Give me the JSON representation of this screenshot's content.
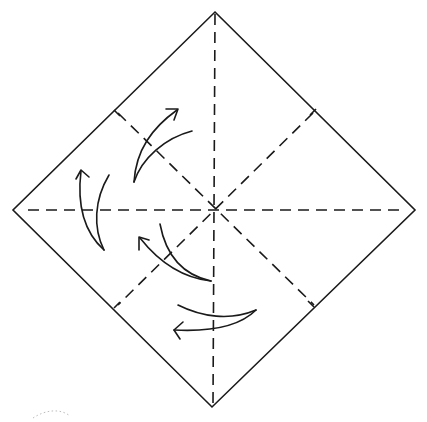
{
  "diagram": {
    "type": "origami-fold-diagram",
    "shape": "square paper rotated 45° (diamond)",
    "colors": {
      "line": "#1a1a1a",
      "background": "#ffffff",
      "faint_mark": "#bdbdbd"
    },
    "vertices": {
      "top": [
        215,
        12
      ],
      "right": [
        415,
        210
      ],
      "bottom": [
        212,
        407
      ],
      "left": [
        13,
        210
      ]
    },
    "center": [
      215,
      210
    ],
    "creases": [
      {
        "name": "vertical-valley-fold",
        "style": "dashed",
        "from": [
          215,
          12
        ],
        "to": [
          212,
          407
        ]
      },
      {
        "name": "horizontal-valley-fold",
        "style": "dashed",
        "from": [
          28,
          210
        ],
        "to": [
          403,
          210
        ]
      },
      {
        "name": "diagonal-fold-tl-br",
        "style": "dashed",
        "from": [
          115,
          110
        ],
        "to": [
          315,
          305
        ]
      },
      {
        "name": "diagonal-fold-tr-bl",
        "style": "dashed",
        "from": [
          315,
          110
        ],
        "to": [
          115,
          305
        ]
      }
    ],
    "arrows": [
      {
        "name": "fold-arrow-upper-left",
        "direction": "up-right"
      },
      {
        "name": "fold-arrow-left",
        "direction": "up"
      },
      {
        "name": "fold-arrow-lower-center",
        "direction": "up-left"
      },
      {
        "name": "fold-arrow-bottom",
        "direction": "left"
      }
    ]
  }
}
